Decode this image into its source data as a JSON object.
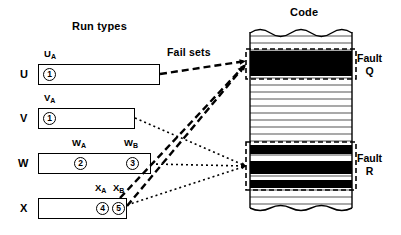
{
  "titles": {
    "run_types": "Run types",
    "code": "Code",
    "fail_sets": "Fail sets"
  },
  "run_types": [
    {
      "row_label": "U",
      "box": {
        "x": 38,
        "y": 64,
        "w": 122,
        "h": 21
      },
      "row_label_pos": {
        "x": 20,
        "y": 68
      },
      "segments": [
        {
          "name": "U_A",
          "label_base": "U",
          "label_sub": "A",
          "label_x": 44,
          "label_y": 48,
          "marker": "1",
          "marker_x": 43,
          "marker_y": 68
        }
      ]
    },
    {
      "row_label": "V",
      "box": {
        "x": 38,
        "y": 108,
        "w": 97,
        "h": 21
      },
      "row_label_pos": {
        "x": 20,
        "y": 112
      },
      "segments": [
        {
          "name": "V_A",
          "label_base": "V",
          "label_sub": "A",
          "label_x": 44,
          "label_y": 92,
          "marker": "1",
          "marker_x": 43,
          "marker_y": 112
        }
      ]
    },
    {
      "row_label": "W",
      "box": {
        "x": 38,
        "y": 153,
        "w": 113,
        "h": 21
      },
      "row_label_pos": {
        "x": 18,
        "y": 157
      },
      "segments": [
        {
          "name": "W_A",
          "label_base": "W",
          "label_sub": "A",
          "label_x": 72,
          "label_y": 137,
          "marker": "2",
          "marker_x": 74,
          "marker_y": 157
        },
        {
          "name": "W_B",
          "label_base": "W",
          "label_sub": "B",
          "label_x": 124,
          "label_y": 137,
          "marker": "3",
          "marker_x": 126,
          "marker_y": 157
        }
      ]
    },
    {
      "row_label": "X",
      "box": {
        "x": 38,
        "y": 198,
        "w": 89,
        "h": 21
      },
      "row_label_pos": {
        "x": 20,
        "y": 202
      },
      "segments": [
        {
          "name": "X_A",
          "label_base": "X",
          "label_sub": "A",
          "label_x": 95,
          "label_y": 182,
          "marker": "4",
          "marker_x": 96,
          "marker_y": 202
        },
        {
          "name": "X_B",
          "label_base": "X",
          "label_sub": "B",
          "label_x": 113,
          "label_y": 182,
          "marker": "5",
          "marker_x": 112,
          "marker_y": 202
        }
      ]
    }
  ],
  "code": {
    "block": {
      "x": 250,
      "y": 27,
      "w": 102,
      "h": 188
    },
    "stripe_spacing": 7,
    "faults": [
      {
        "id": "Q",
        "label_line1": "Fault",
        "label_line2": "Q",
        "region": {
          "x": 246,
          "y": 49,
          "w": 110,
          "h": 30
        },
        "bands": [
          {
            "y": 51,
            "h": 25,
            "fill": "#000000"
          }
        ]
      },
      {
        "id": "R",
        "label_line1": "Fault",
        "label_line2": "R",
        "region": {
          "x": 246,
          "y": 142,
          "w": 110,
          "h": 48
        },
        "bands": [
          {
            "y": 145,
            "h": 9,
            "fill": "#000000"
          },
          {
            "y": 161,
            "h": 13,
            "fill": "#000000"
          },
          {
            "y": 180,
            "h": 8,
            "fill": "#000000"
          }
        ]
      }
    ]
  },
  "connectors": [
    {
      "name": "u-to-fault-q",
      "style": "dashed",
      "from": {
        "x": 160,
        "y": 74
      },
      "to": {
        "x": 246,
        "y": 61
      }
    },
    {
      "name": "x-to-fault-q",
      "style": "dashed",
      "from": {
        "x": 127,
        "y": 206
      },
      "to": {
        "x": 246,
        "y": 64
      }
    },
    {
      "name": "x-inner-to-fault-q",
      "style": "dashed",
      "from": {
        "x": 120,
        "y": 198
      },
      "to": {
        "x": 244,
        "y": 66
      }
    },
    {
      "name": "v-to-fault-r",
      "style": "dotted",
      "from": {
        "x": 135,
        "y": 118
      },
      "to": {
        "x": 246,
        "y": 166
      }
    },
    {
      "name": "w-to-fault-r",
      "style": "dotted",
      "from": {
        "x": 151,
        "y": 164
      },
      "to": {
        "x": 246,
        "y": 166
      }
    },
    {
      "name": "x-to-fault-r",
      "style": "dotted",
      "from": {
        "x": 127,
        "y": 205
      },
      "to": {
        "x": 246,
        "y": 166
      }
    }
  ],
  "colors": {
    "stroke": "#000000",
    "fault_fill": "#000000",
    "background": "#ffffff",
    "stripe": "#555555"
  }
}
